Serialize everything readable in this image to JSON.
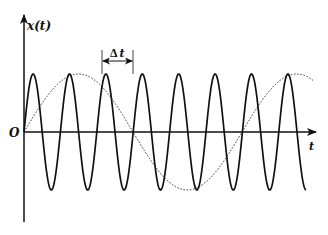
{
  "figure": {
    "y_axis_label": "x(t)",
    "x_axis_label": "t",
    "origin_label": "O",
    "interval_label_delta": "Δ",
    "interval_label_var": "t"
  },
  "chart_data": {
    "type": "line",
    "title": "",
    "xlabel": "t",
    "ylabel": "x(t)",
    "grid": false,
    "legend": null,
    "series": [
      {
        "name": "fast oscillation (solid)",
        "style": "solid",
        "amplitude": 1.0,
        "period_px": 36.4,
        "start_phase": "sine from origin, increasing",
        "peaks_x_px": [
          33,
          69,
          106,
          142,
          179,
          215,
          252,
          288
        ],
        "troughs_x_px": [
          51,
          88,
          124,
          160,
          197,
          233,
          270,
          306
        ],
        "ends_at": "trough"
      },
      {
        "name": "slow oscillation (dotted)",
        "style": "dotted",
        "amplitude": 1.0,
        "period_px": 218,
        "start_phase": "sine from origin, increasing",
        "key_points_x_px": {
          "peak": 78,
          "zero_down": 133,
          "trough": 188,
          "zero_up": 242,
          "peak2": 297
        }
      }
    ],
    "annotations": [
      {
        "type": "interval",
        "label": "Δt",
        "from_x_px": 102,
        "to_x_px": 133,
        "meaning": "one period of fast oscillation"
      }
    ],
    "geometry_px": {
      "origin": [
        24,
        132
      ],
      "amplitude": 58,
      "x_axis_end": 316,
      "y_axis_top": 15,
      "y_axis_bottom": 222,
      "fast_end_x": 306,
      "slow_end_x": 313
    }
  }
}
